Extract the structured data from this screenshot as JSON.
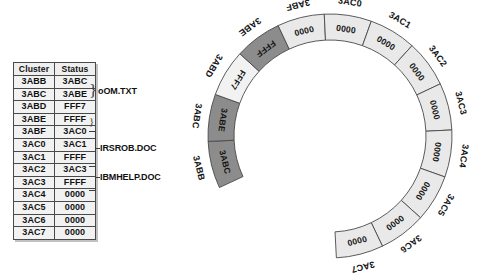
{
  "figure": {
    "caption": ""
  },
  "table": {
    "headers": [
      "Cluster",
      "Status"
    ],
    "rows": [
      {
        "cluster": "3ABB",
        "status": "3ABC"
      },
      {
        "cluster": "3ABC",
        "status": "3ABE"
      },
      {
        "cluster": "3ABD",
        "status": "FFF7"
      },
      {
        "cluster": "3ABE",
        "status": "FFFF"
      },
      {
        "cluster": "3ABF",
        "status": "3AC0"
      },
      {
        "cluster": "3AC0",
        "status": "3AC1"
      },
      {
        "cluster": "3AC1",
        "status": "FFFF"
      },
      {
        "cluster": "3AC2",
        "status": "3AC3"
      },
      {
        "cluster": "3AC3",
        "status": "FFFF"
      },
      {
        "cluster": "3AC4",
        "status": "0000"
      },
      {
        "cluster": "3AC5",
        "status": "0000"
      },
      {
        "cluster": "3AC6",
        "status": "0000"
      },
      {
        "cluster": "3AC7",
        "status": "0000"
      }
    ]
  },
  "file_labels": [
    {
      "name": "oOM.TXT",
      "spans": [
        "3ABB",
        "3ABC"
      ]
    },
    {
      "name": "IRSROB.DOC",
      "spans": [
        "3ABF",
        "3AC0",
        "3AC1"
      ]
    },
    {
      "name": "IBMHELP.DOC",
      "spans": [
        "3AC2",
        "3AC3"
      ]
    }
  ],
  "ring": {
    "side_label": "3ABD",
    "colors": {
      "used": "#8c8c8c",
      "free": "#e9e9e9",
      "bad": "#f2f2f2",
      "outline": "#4a4a4a"
    },
    "segments": [
      {
        "cluster": "3ABB",
        "status": "3ABC",
        "state": "used"
      },
      {
        "cluster": "3ABC",
        "status": "3ABE",
        "state": "used"
      },
      {
        "cluster": "3ABD",
        "status": "FFF7",
        "state": "bad"
      },
      {
        "cluster": "3ABE",
        "status": "FFFF",
        "state": "used"
      },
      {
        "cluster": "3ABF",
        "status": "0000",
        "state": "free"
      },
      {
        "cluster": "3AC0",
        "status": "0000",
        "state": "free"
      },
      {
        "cluster": "3AC1",
        "status": "0000",
        "state": "free"
      },
      {
        "cluster": "3AC2",
        "status": "0000",
        "state": "free"
      },
      {
        "cluster": "3AC3",
        "status": "0000",
        "state": "free"
      },
      {
        "cluster": "3AC4",
        "status": "0000",
        "state": "free"
      },
      {
        "cluster": "3AC5",
        "status": "0000",
        "state": "free"
      },
      {
        "cluster": "3AC6",
        "status": "0000",
        "state": "free"
      },
      {
        "cluster": "3AC7",
        "status": "0000",
        "state": "free"
      }
    ]
  }
}
